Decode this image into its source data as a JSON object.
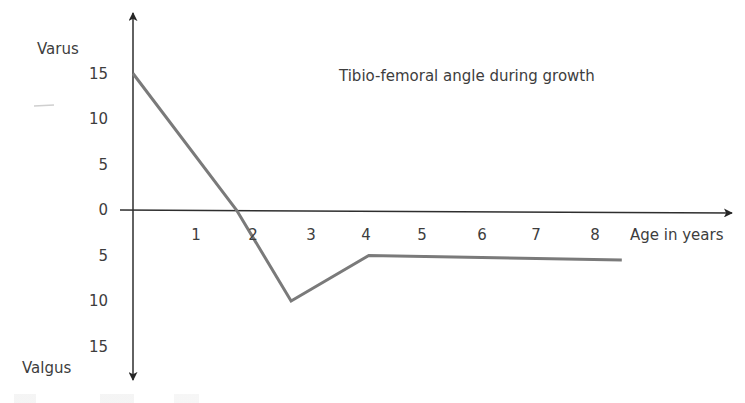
{
  "chart_data": {
    "type": "line",
    "title": "Tibio-femoral angle during growth",
    "xlabel": "Age in years",
    "ylabel_top": "Varus",
    "ylabel_bottom": "Valgus",
    "x_ticks": [
      "1",
      "2",
      "3",
      "4",
      "5",
      "6",
      "7",
      "8"
    ],
    "y_ticks_up": [
      "15",
      "10",
      "5",
      "0"
    ],
    "y_ticks_down": [
      "5",
      "10",
      "15"
    ],
    "y_note": "Positive values = varus (upward), values below axis = valgus (downward, shown as positive magnitudes)",
    "xlim": [
      0,
      9.5
    ],
    "ylim": [
      -17,
      19
    ],
    "grid": false,
    "series": [
      {
        "name": "Tibio-femoral angle",
        "x": [
          0,
          1.8,
          2.75,
          4.1,
          8.5
        ],
        "y": [
          15,
          0,
          -10,
          -5,
          -5.5
        ]
      }
    ],
    "colors": {
      "axis": "#2e2e2e",
      "line": "#7a7a7a",
      "text": "#3d3d3d"
    }
  }
}
